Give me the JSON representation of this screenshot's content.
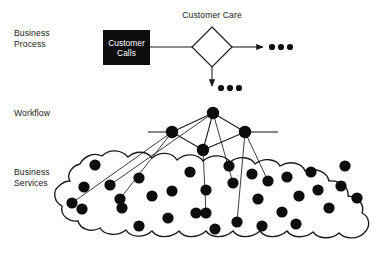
{
  "diagram": {
    "background_color": "#ffffff",
    "ink_color": "#1a1a1a",
    "fill_color": "#0d0d0d",
    "layers": [
      {
        "id": "business-process",
        "label_line1": "Business",
        "label_line2": "Process",
        "label_x": 14,
        "label_y": 36
      },
      {
        "id": "workflow",
        "label_line1": "Workflow",
        "label_line2": "",
        "label_x": 14,
        "label_y": 116
      },
      {
        "id": "business-services",
        "label_line1": "Business",
        "label_line2": "Services",
        "label_x": 14,
        "label_y": 175
      }
    ],
    "process": {
      "box": {
        "label_line1": "Customer",
        "label_line2": "Calls",
        "x": 103,
        "y": 30,
        "width": 47,
        "height": 35,
        "fill": "#0d0d0d",
        "text_color": "#ffffff"
      },
      "decision": {
        "label": "Customer Care",
        "label_x": 212,
        "label_y": 18,
        "cx": 212,
        "cy": 47,
        "rx": 20,
        "ry": 20
      },
      "flow_right": {
        "from_x": 150,
        "from_y": 47,
        "to_x": 192,
        "to_y": 47
      },
      "arrow_right": {
        "from_x": 232,
        "from_y": 47,
        "to_x": 263,
        "to_y": 47
      },
      "arrow_down": {
        "from_x": 212,
        "from_y": 67,
        "to_x": 212,
        "to_y": 86
      },
      "ellipsis_right": {
        "cx_list": [
          272,
          281,
          290
        ],
        "cy": 47,
        "r": 3.1
      },
      "ellipsis_down": {
        "cx_list": [
          221,
          230,
          239
        ],
        "cy": 88,
        "r": 3.1
      }
    },
    "workflow": {
      "nodes": [
        {
          "id": "wf-top",
          "cx": 213,
          "cy": 113,
          "r": 6.2
        },
        {
          "id": "wf-left",
          "cx": 172,
          "cy": 132,
          "r": 6.2
        },
        {
          "id": "wf-right",
          "cx": 245,
          "cy": 132,
          "r": 6.2
        },
        {
          "id": "wf-center",
          "cx": 203,
          "cy": 150,
          "r": 6.2
        }
      ],
      "edges": [
        {
          "from": "wf-top",
          "to": "wf-left"
        },
        {
          "from": "wf-top",
          "to": "wf-right"
        },
        {
          "from": "wf-top",
          "to": "wf-center"
        },
        {
          "from": "wf-left",
          "to": "wf-center"
        },
        {
          "from": "wf-center",
          "to": "wf-right"
        }
      ],
      "rail_left": {
        "x1": 148,
        "y1": 132,
        "x2": 166,
        "y2": 132
      },
      "rail_right": {
        "x1": 251,
        "y1": 132,
        "x2": 278,
        "y2": 132
      },
      "drill_down": [
        {
          "from": "wf-left",
          "to_x": 72,
          "to_y": 203
        },
        {
          "from": "wf-left",
          "to_x": 120,
          "to_y": 199
        },
        {
          "from": "wf-top",
          "to_x": 110,
          "to_y": 185
        },
        {
          "from": "wf-top",
          "to_x": 233,
          "to_y": 183
        },
        {
          "from": "wf-center",
          "to_x": 206,
          "to_y": 213
        },
        {
          "from": "wf-right",
          "to_x": 237,
          "to_y": 222
        },
        {
          "from": "wf-right",
          "to_x": 268,
          "to_y": 181
        }
      ]
    },
    "services": {
      "blob_path": "M 70 181 C 66 174 72 166 80 164 C 84 156 94 152 102 156 C 110 148 122 150 128 157 C 136 150 147 151 152 158 C 160 151 172 152 177 160 C 186 152 198 154 203 161 C 212 153 225 155 230 162 C 239 155 251 157 255 164 C 264 157 276 159 280 166 C 290 160 302 163 305 171 C 316 167 327 172 329 181 C 340 180 349 187 348 196 C 358 197 365 204 362 213 C 370 217 371 227 364 233 C 357 240 345 239 339 233 C 331 240 318 239 313 232 C 304 239 292 238 287 231 C 278 239 265 238 260 231 C 251 239 238 238 233 231 C 224 239 211 238 206 231 C 197 239 184 238 179 231 C 170 239 157 238 152 231 C 143 239 130 237 126 230 C 117 237 104 235 100 228 C 91 233 80 229 78 221 C 68 222 60 215 62 206 C 54 202 52 191 59 186 C 62 183 66 181 70 181 Z",
      "dots": [
        {
          "cx": 95,
          "cy": 165,
          "r": 5.6
        },
        {
          "cx": 84,
          "cy": 187,
          "r": 5.6
        },
        {
          "cx": 110,
          "cy": 185,
          "r": 5.6
        },
        {
          "cx": 139,
          "cy": 178,
          "r": 5.6
        },
        {
          "cx": 82,
          "cy": 209,
          "r": 5.6
        },
        {
          "cx": 122,
          "cy": 208,
          "r": 5.6
        },
        {
          "cx": 152,
          "cy": 196,
          "r": 5.6
        },
        {
          "cx": 72,
          "cy": 203,
          "r": 5.6
        },
        {
          "cx": 168,
          "cy": 218,
          "r": 5.6
        },
        {
          "cx": 120,
          "cy": 199,
          "r": 5.6
        },
        {
          "cx": 190,
          "cy": 172,
          "r": 5.6
        },
        {
          "cx": 206,
          "cy": 190,
          "r": 5.6
        },
        {
          "cx": 196,
          "cy": 213,
          "r": 5.6
        },
        {
          "cx": 172,
          "cy": 191,
          "r": 5.6
        },
        {
          "cx": 233,
          "cy": 183,
          "r": 5.6
        },
        {
          "cx": 215,
          "cy": 229,
          "r": 5.6
        },
        {
          "cx": 206,
          "cy": 213,
          "r": 5.6
        },
        {
          "cx": 237,
          "cy": 222,
          "r": 5.6
        },
        {
          "cx": 252,
          "cy": 174,
          "r": 5.6
        },
        {
          "cx": 258,
          "cy": 199,
          "r": 5.6
        },
        {
          "cx": 268,
          "cy": 181,
          "r": 5.6
        },
        {
          "cx": 282,
          "cy": 212,
          "r": 5.6
        },
        {
          "cx": 287,
          "cy": 177,
          "r": 5.6
        },
        {
          "cx": 299,
          "cy": 196,
          "r": 5.6
        },
        {
          "cx": 311,
          "cy": 172,
          "r": 5.6
        },
        {
          "cx": 318,
          "cy": 190,
          "r": 5.6
        },
        {
          "cx": 296,
          "cy": 224,
          "r": 5.6
        },
        {
          "cx": 329,
          "cy": 208,
          "r": 5.6
        },
        {
          "cx": 341,
          "cy": 186,
          "r": 5.6
        },
        {
          "cx": 345,
          "cy": 166,
          "r": 5.6
        },
        {
          "cx": 357,
          "cy": 198,
          "r": 5.6
        },
        {
          "cx": 229,
          "cy": 166,
          "r": 5.6
        },
        {
          "cx": 139,
          "cy": 226,
          "r": 5.6
        },
        {
          "cx": 262,
          "cy": 226,
          "r": 5.6
        }
      ]
    }
  }
}
